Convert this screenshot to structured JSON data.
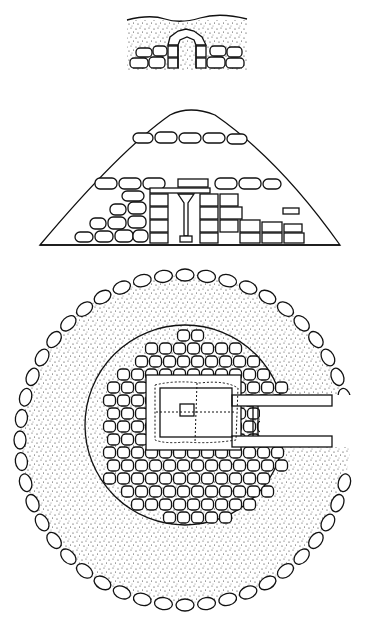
{
  "figure": {
    "type": "archaeological line drawing",
    "views": [
      {
        "id": "entrance-elevation",
        "description": "front elevation of passage entrance with corbelled stone doorway"
      },
      {
        "id": "cross-section",
        "description": "section through earth mound showing dry-stone chamber walls and central pillar"
      },
      {
        "id": "ground-plan",
        "description": "plan of circular cairn with kerb stones, stone fill and rectangular chamber with passage"
      }
    ],
    "colors": {
      "ink": "#111111",
      "paper": "#ffffff"
    }
  }
}
